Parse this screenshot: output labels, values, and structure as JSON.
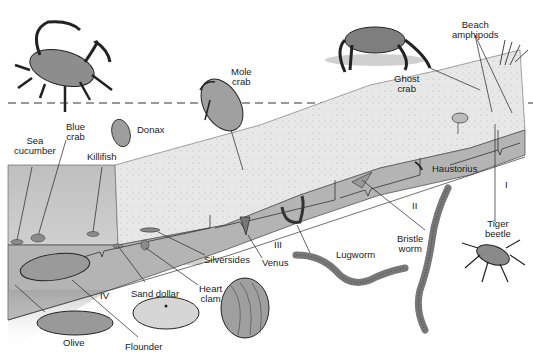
{
  "diagram": {
    "type": "beach zonation illustration",
    "zones": [
      {
        "id": "I",
        "label": "I"
      },
      {
        "id": "II",
        "label": "II"
      },
      {
        "id": "III",
        "label": "III"
      },
      {
        "id": "IV",
        "label": "IV"
      }
    ],
    "organisms": {
      "blue_crab": "Blue\ncrab",
      "donax": "Donax",
      "mole_crab": "Mole\ncrab",
      "ghost_crab": "Ghost\ncrab",
      "beach_amphipods": "Beach\namphipods",
      "sea_cucumber": "Sea\ncucumber",
      "killifish": "Killifish",
      "haustorius": "Haustorius",
      "tiger_beetle": "Tiger\nbeetle",
      "bristle_worm": "Bristle\nworm",
      "lugworm": "Lugworm",
      "venus": "Venus",
      "silversides": "Silversides",
      "heart_clam": "Heart\nclam",
      "sand_dollar": "Sand dollar",
      "olive": "Olive",
      "flounder": "Flounder"
    },
    "colors": {
      "sand": "#e6e6e6",
      "water": "#bdbdbd",
      "cross_section": "#a9a9a9",
      "ink": "#1a1a1a"
    }
  }
}
